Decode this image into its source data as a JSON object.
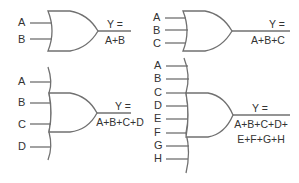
{
  "diagram": {
    "stroke_color": "#707070",
    "text_color": "#333333",
    "gates": [
      {
        "name": "two-input-or",
        "inputs": [
          "A",
          "B"
        ],
        "output_label": "Y =",
        "expression": [
          "A+B"
        ]
      },
      {
        "name": "three-input-or",
        "inputs": [
          "A",
          "B",
          "C"
        ],
        "output_label": "Y =",
        "expression": [
          "A+B+C"
        ]
      },
      {
        "name": "four-input-or",
        "inputs": [
          "A",
          "B",
          "C",
          "D"
        ],
        "output_label": "Y =",
        "expression": [
          "A+B+C+D"
        ]
      },
      {
        "name": "eight-input-or",
        "inputs": [
          "A",
          "B",
          "C",
          "D",
          "E",
          "F",
          "G",
          "H"
        ],
        "output_label": "Y =",
        "expression": [
          "A+B+C+D+",
          "E+F+G+H"
        ]
      }
    ]
  }
}
